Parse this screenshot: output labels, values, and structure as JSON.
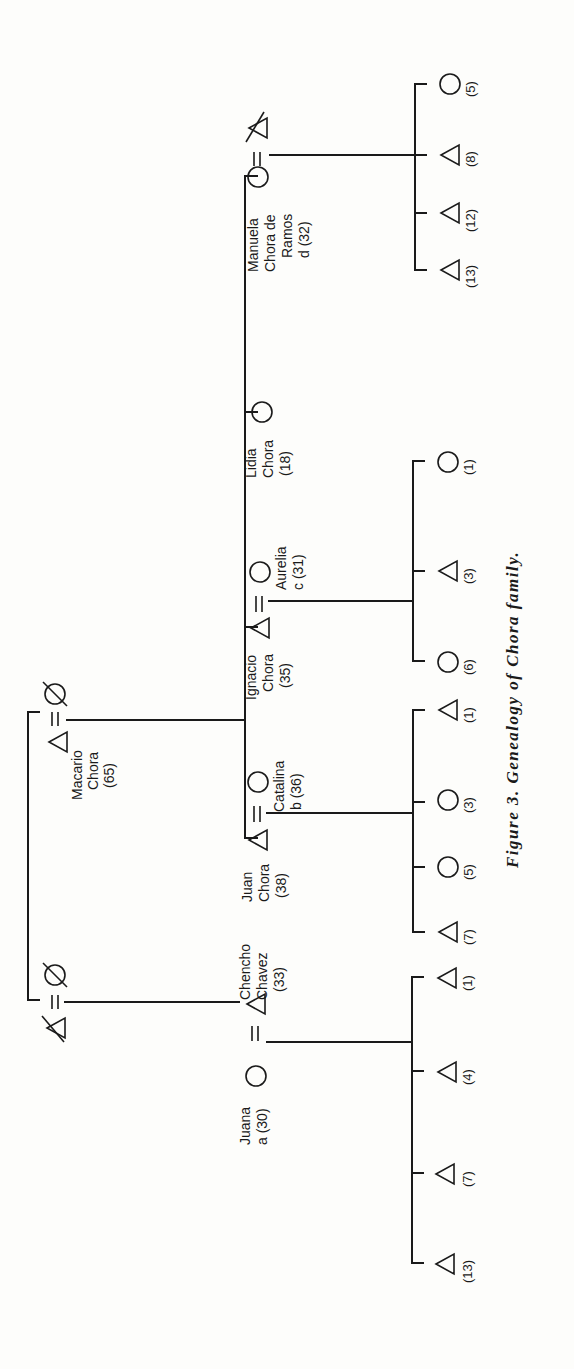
{
  "figure": {
    "caption": "Figure 3. Genealogy of Chora family.",
    "orientation": "rotated 90° counter-clockwise",
    "legend": {
      "triangle": "male",
      "circle": "female",
      "double_line": "marriage",
      "slash": "deceased"
    }
  },
  "grandparents": {
    "macario_couple": {
      "husband": {
        "name_line1": "Macario",
        "name_line2": "Chora",
        "age": "(65)",
        "symbol": "triangle"
      },
      "wife": {
        "symbol": "circle",
        "deceased": true
      }
    },
    "chavez_couple": {
      "husband": {
        "symbol": "triangle",
        "deceased": true
      },
      "wife": {
        "symbol": "circle",
        "deceased": true
      }
    }
  },
  "generation2": [
    {
      "id": "manuela",
      "person": {
        "name_line1": "Manuela",
        "name_line2": "Chora de",
        "name_line3": "Ramos",
        "name_line4": "d (32)",
        "symbol": "circle"
      },
      "spouse": {
        "symbol": "triangle",
        "deceased": true
      },
      "children": [
        {
          "symbol": "triangle",
          "age": "(13)"
        },
        {
          "symbol": "triangle",
          "age": "(12)"
        },
        {
          "symbol": "triangle",
          "age": "(8)"
        },
        {
          "symbol": "circle",
          "age": "(5)"
        }
      ]
    },
    {
      "id": "lidia",
      "person": {
        "name_line1": "Lidia",
        "name_line2": "Chora",
        "name_line3": "(18)",
        "symbol": "circle"
      }
    },
    {
      "id": "ignacio",
      "person": {
        "name_line1": "Ignacio",
        "name_line2": "Chora",
        "name_line3": "(35)",
        "symbol": "triangle"
      },
      "spouse": {
        "name_line1": "Aurelia",
        "name_line2": "c (31)",
        "symbol": "circle"
      },
      "children": [
        {
          "symbol": "circle",
          "age": "(6)"
        },
        {
          "symbol": "triangle",
          "age": "(3)"
        },
        {
          "symbol": "circle",
          "age": "(1)"
        }
      ]
    },
    {
      "id": "juan",
      "person": {
        "name_line1": "Juan",
        "name_line2": "Chora",
        "name_line3": "(38)",
        "symbol": "triangle"
      },
      "spouse": {
        "name_line1": "Catalina",
        "name_line2": "b (36)",
        "symbol": "circle"
      },
      "children": [
        {
          "symbol": "triangle",
          "age": "(7)"
        },
        {
          "symbol": "circle",
          "age": "(5)"
        },
        {
          "symbol": "circle",
          "age": "(3)"
        },
        {
          "symbol": "triangle",
          "age": "(1)"
        }
      ]
    },
    {
      "id": "chencho",
      "person": {
        "name_line1": "Chencho",
        "name_line2": "Chavez",
        "name_line3": "(33)",
        "symbol": "triangle"
      },
      "spouse": {
        "name_line1": "Juana",
        "name_line2": "a (30)",
        "symbol": "circle"
      },
      "children": [
        {
          "symbol": "triangle",
          "age": "(13)"
        },
        {
          "symbol": "triangle",
          "age": "(7)"
        },
        {
          "symbol": "triangle",
          "age": "(4)"
        },
        {
          "symbol": "triangle",
          "age": "(1)"
        }
      ]
    }
  ]
}
